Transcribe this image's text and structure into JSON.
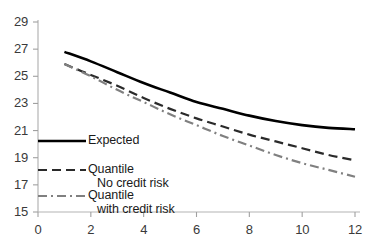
{
  "chart_data": {
    "type": "line",
    "title": "",
    "subtitle": "",
    "xlabel": "",
    "ylabel": "",
    "xlim": [
      0,
      12
    ],
    "ylim": [
      15,
      29
    ],
    "grid": false,
    "legend_position": "inside-left-lower",
    "x_ticks": [
      "0",
      "2",
      "4",
      "6",
      "8",
      "10",
      "12"
    ],
    "y_ticks": [
      "15",
      "17",
      "19",
      "21",
      "23",
      "25",
      "27",
      "29"
    ],
    "x": [
      1,
      2,
      3,
      4,
      5,
      6,
      7,
      8,
      9,
      10,
      11,
      12
    ],
    "series": [
      {
        "name": "Expected",
        "style": "solid",
        "color": "#000000",
        "width": 2.6,
        "values": [
          26.8,
          26.1,
          25.3,
          24.5,
          23.8,
          23.1,
          22.6,
          22.1,
          21.7,
          21.4,
          21.2,
          21.1
        ]
      },
      {
        "name": "Quantile No credit risk",
        "style": "dashed",
        "color": "#2a2a2a",
        "width": 2.2,
        "values": [
          25.9,
          25.1,
          24.3,
          23.4,
          22.6,
          21.9,
          21.3,
          20.7,
          20.2,
          19.7,
          19.2,
          18.8
        ]
      },
      {
        "name": "Quantile with credit risk",
        "style": "dashdot",
        "color": "#808080",
        "width": 2.2,
        "values": [
          25.9,
          25.0,
          24.0,
          23.1,
          22.2,
          21.4,
          20.6,
          19.9,
          19.2,
          18.6,
          18.1,
          17.6
        ]
      }
    ]
  },
  "legend": {
    "items": [
      {
        "label_line1": "Expected",
        "label_line2": ""
      },
      {
        "label_line1": "Quantile",
        "label_line2": "No credit risk"
      },
      {
        "label_line1": "Quantile",
        "label_line2": "with credit risk"
      }
    ]
  },
  "axes": {
    "axis_color": "#b4b4b4",
    "tick_color": "#a0a0a0",
    "label_color": "#3a3a3a"
  }
}
